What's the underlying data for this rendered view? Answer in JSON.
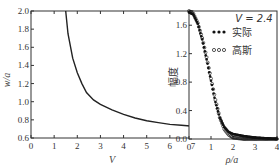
{
  "chart_data": [
    {
      "type": "line",
      "title": "",
      "xlabel": "V",
      "ylabel": "w/a",
      "xlim": [
        0,
        7
      ],
      "ylim": [
        0.6,
        2.0
      ],
      "xticks": [
        "0",
        "1",
        "2",
        "3",
        "4",
        "5",
        "6",
        "7"
      ],
      "yticks": [
        "0.6",
        "0.8",
        "1.0",
        "1.2",
        "1.4",
        "1.6",
        "1.8",
        "2.0"
      ],
      "grid": false,
      "series": [
        {
          "name": "w/a",
          "x": [
            1.5,
            1.6,
            1.8,
            2.0,
            2.2,
            2.4,
            2.7,
            3.0,
            3.5,
            4.0,
            4.5,
            5.0,
            5.5,
            6.0,
            6.5,
            7.0
          ],
          "y": [
            2.0,
            1.75,
            1.48,
            1.32,
            1.2,
            1.1,
            1.02,
            0.97,
            0.91,
            0.86,
            0.82,
            0.79,
            0.77,
            0.75,
            0.74,
            0.73
          ]
        }
      ]
    },
    {
      "type": "scatter",
      "title": "",
      "xlabel": "ρ/a",
      "ylabel": "幅度",
      "xlim": [
        0,
        4
      ],
      "ylim": [
        0.0,
        1.8
      ],
      "xticks": [
        "0",
        "1",
        "2",
        "3",
        "4"
      ],
      "yticks": [
        "0.0",
        "0.4",
        "0.8",
        "1.2",
        "1.6"
      ],
      "grid": false,
      "annotation": "V = 2.4",
      "legend": [
        "实际",
        "高斯"
      ],
      "legend_position": "upper right",
      "series": [
        {
          "name": "实际",
          "marker": "filled",
          "x": [
            0,
            0.2,
            0.4,
            0.6,
            0.8,
            1.0,
            1.2,
            1.4,
            1.6,
            1.8,
            2.0,
            2.5,
            3.0,
            3.5,
            4.0
          ],
          "y": [
            1.78,
            1.75,
            1.62,
            1.4,
            1.12,
            0.82,
            0.52,
            0.3,
            0.17,
            0.1,
            0.07,
            0.04,
            0.02,
            0.01,
            0.0
          ]
        },
        {
          "name": "高斯",
          "marker": "open",
          "x": [
            0,
            0.2,
            0.4,
            0.6,
            0.8,
            1.0,
            1.2,
            1.4,
            1.6,
            1.8,
            2.0,
            2.5,
            3.0,
            3.5,
            4.0
          ],
          "y": [
            1.8,
            1.76,
            1.63,
            1.42,
            1.15,
            0.85,
            0.55,
            0.3,
            0.14,
            0.06,
            0.02,
            0.0,
            0.0,
            0.0,
            0.0
          ]
        }
      ]
    }
  ],
  "left_chart": {
    "xlabel": "V",
    "ylabel": "w/a",
    "xticks": [
      "0",
      "1",
      "2",
      "3",
      "4",
      "5",
      "6",
      "7"
    ],
    "yticks": [
      "0.6",
      "0.8",
      "1.0",
      "1.2",
      "1.4",
      "1.6",
      "1.8",
      "2.0"
    ]
  },
  "right_chart": {
    "xlabel": "ρ/a",
    "ylabel": "幅度",
    "xticks": [
      "0",
      "1",
      "2",
      "3",
      "4"
    ],
    "yticks": [
      "0.0",
      "0.4",
      "0.8",
      "1.2",
      "1.6"
    ],
    "annotation": "V = 2.4",
    "legend": [
      {
        "marker": "•••",
        "label": "实际"
      },
      {
        "marker": "∘∘∘",
        "label": "高斯"
      }
    ]
  }
}
